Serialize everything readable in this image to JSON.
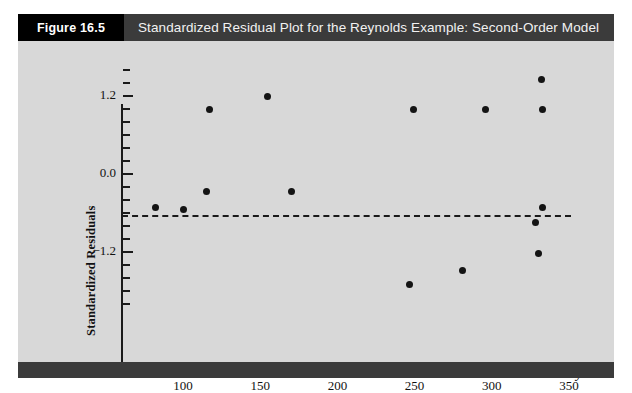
{
  "header": {
    "figure_number": "Figure 16.5",
    "title": "Standardized Residual Plot for the Reynolds Example: Second-Order Model"
  },
  "colors": {
    "header_black": "#000000",
    "header_gray": "#3b3b3b",
    "panel_bg": "#d8d8d8",
    "axis": "#1a1a1a",
    "point": "#141414",
    "page_bg": "#ffffff"
  },
  "chart_data": {
    "type": "scatter",
    "title": "Standardized Residual Plot for the Reynolds Example: Second-Order Model",
    "xlabel": "ŷ",
    "ylabel": "Standardized Residuals",
    "xlim": [
      75,
      360
    ],
    "ylim": [
      -2.1,
      1.7
    ],
    "grid": false,
    "legend": null,
    "xticks": [
      100,
      150,
      200,
      250,
      300,
      350
    ],
    "xtick_labels": [
      "100",
      "150",
      "200",
      "250",
      "300",
      "350"
    ],
    "yticks": [
      1.2,
      0.0,
      -1.2
    ],
    "ytick_labels": [
      "1.2",
      "0.0",
      "−1.2"
    ],
    "y_minor_tick_count": 17,
    "reference_line": {
      "y": 0.0,
      "style": "dashed",
      "color": "#1a1a1a"
    },
    "points": [
      {
        "x": 82,
        "y": -0.52
      },
      {
        "x": 100,
        "y": -0.54
      },
      {
        "x": 115,
        "y": -0.27
      },
      {
        "x": 117,
        "y": 1.0
      },
      {
        "x": 155,
        "y": 1.2
      },
      {
        "x": 170,
        "y": -0.27
      },
      {
        "x": 247,
        "y": -1.7
      },
      {
        "x": 249,
        "y": 1.0
      },
      {
        "x": 281,
        "y": -1.48
      },
      {
        "x": 296,
        "y": 1.0
      },
      {
        "x": 328,
        "y": -0.75
      },
      {
        "x": 330,
        "y": -1.22
      },
      {
        "x": 332,
        "y": 1.45
      },
      {
        "x": 333,
        "y": -0.52
      },
      {
        "x": 333,
        "y": 1.0
      }
    ]
  }
}
